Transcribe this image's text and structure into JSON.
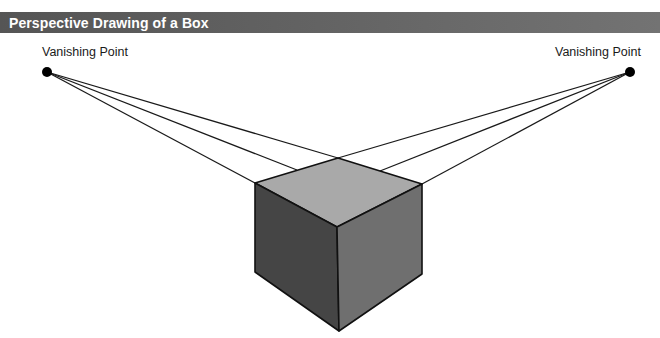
{
  "header": {
    "title": "Perspective Drawing of a Box"
  },
  "labels": {
    "left_vanishing_point": "Vanishing Point",
    "right_vanishing_point": "Vanishing Point"
  },
  "colors": {
    "header_bg_left": "#555555",
    "header_bg_right": "#737373",
    "header_text": "#ffffff",
    "top_face": "#a9a9a9",
    "left_face": "#454545",
    "right_face": "#6f6f6f",
    "line": "#1a1a1a"
  },
  "diagram": {
    "vanishing_points": [
      {
        "name": "left",
        "x": 47,
        "y": 72
      },
      {
        "name": "right",
        "x": 630,
        "y": 72
      }
    ],
    "box_vertices": {
      "back_top": [
        338,
        158
      ],
      "left_top": [
        255,
        183
      ],
      "right_top": [
        422,
        184
      ],
      "front_top": [
        337,
        227
      ],
      "left_bottom": [
        255,
        272
      ],
      "right_bottom": [
        422,
        274
      ],
      "front_bottom": [
        339,
        331
      ]
    },
    "faces": [
      "top",
      "left",
      "right"
    ]
  }
}
